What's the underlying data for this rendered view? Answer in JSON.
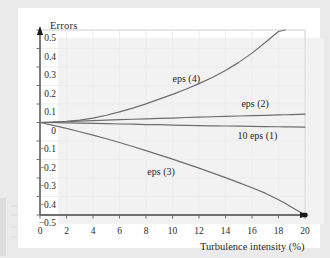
{
  "figure": {
    "background_color": "#eaeaea",
    "panel_color": "#ffffff"
  },
  "chart_data": {
    "type": "line",
    "title": "",
    "ylabel": "Errors",
    "xlabel": "Turbulence intensity (%)",
    "xlim": [
      0,
      20
    ],
    "ylim": [
      -0.5,
      0.5
    ],
    "xticks": [
      "0",
      "2",
      "4",
      "6",
      "8",
      "10",
      "12",
      "14",
      "16",
      "18",
      "20"
    ],
    "xtick_values": [
      0,
      2,
      4,
      6,
      8,
      10,
      12,
      14,
      16,
      18,
      20
    ],
    "yticks": [
      "0.5",
      "0.4",
      "0.3",
      "0.2",
      "0.1",
      "0",
      "−0.1",
      "−0.2",
      "−0.3",
      "−0.4",
      "−0.5"
    ],
    "ytick_values": [
      0.5,
      0.4,
      0.3,
      0.2,
      0.1,
      0,
      -0.1,
      -0.2,
      -0.3,
      -0.4,
      -0.5
    ],
    "grid": true,
    "grid_color": "#ededed",
    "axis_color": "#6f6f6f",
    "legend": "inline-labels",
    "x": [
      0,
      1,
      2,
      3,
      4,
      5,
      6,
      7,
      8,
      9,
      10,
      11,
      12,
      13,
      14,
      15,
      16,
      17,
      18,
      18.5,
      19,
      20
    ],
    "series": [
      {
        "name": "eps (4)",
        "label": "eps (4)",
        "color": "#6d6d6d",
        "values": [
          0,
          0.002,
          0.006,
          0.013,
          0.024,
          0.039,
          0.057,
          0.078,
          0.101,
          0.126,
          0.152,
          0.18,
          0.21,
          0.243,
          0.281,
          0.325,
          0.375,
          0.432,
          0.492,
          0.5,
          null,
          null
        ],
        "label_x": 10.0,
        "label_y": 0.235,
        "clipped_at_top": true,
        "exit_x": 18.5
      },
      {
        "name": "eps (2)",
        "label": "eps (2)",
        "color": "#6d6d6d",
        "values": [
          0,
          0.0025,
          0.005,
          0.0075,
          0.01,
          0.0125,
          0.015,
          0.0175,
          0.02,
          0.0225,
          0.024,
          0.027,
          0.029,
          0.031,
          0.033,
          0.035,
          0.037,
          0.039,
          0.041,
          0.042,
          0.043,
          0.045
        ],
        "label_x": 15.2,
        "label_y": 0.098
      },
      {
        "name": "10 eps (1)",
        "label": "10 eps (1)",
        "color": "#6d6d6d",
        "values": [
          0,
          -0.001,
          -0.002,
          -0.003,
          -0.005,
          -0.006,
          -0.008,
          -0.009,
          -0.011,
          -0.012,
          -0.014,
          -0.015,
          -0.017,
          -0.018,
          -0.019,
          -0.02,
          -0.021,
          -0.022,
          -0.023,
          -0.0235,
          -0.024,
          -0.025
        ],
        "label_x": 14.9,
        "label_y": -0.075
      },
      {
        "name": "eps (3)",
        "label": "eps (3)",
        "color": "#6d6d6d",
        "values": [
          0,
          -0.016,
          -0.032,
          -0.05,
          -0.068,
          -0.088,
          -0.108,
          -0.13,
          -0.152,
          -0.175,
          -0.198,
          -0.222,
          -0.247,
          -0.272,
          -0.298,
          -0.325,
          -0.353,
          -0.382,
          -0.418,
          -0.437,
          -0.458,
          -0.5
        ],
        "label_x": 8.1,
        "label_y": -0.268,
        "endpoint_marker": true
      }
    ]
  }
}
